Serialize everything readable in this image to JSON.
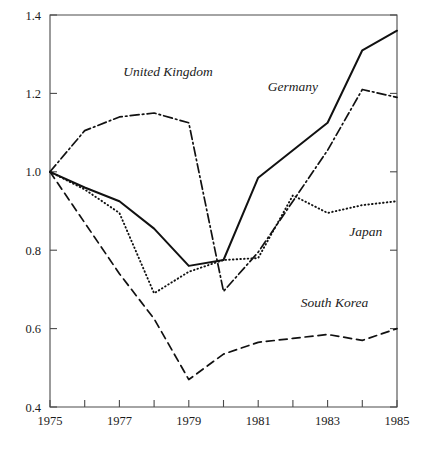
{
  "chart_data": {
    "type": "line",
    "title": "",
    "subtitle": "",
    "xlabel": "",
    "ylabel": "",
    "xlim": [
      1975,
      1985
    ],
    "ylim": [
      0.4,
      1.4
    ],
    "grid": false,
    "legend_position": "inline-annotations",
    "x": [
      1975,
      1976,
      1977,
      1978,
      1979,
      1980,
      1981,
      1982,
      1983,
      1984,
      1985
    ],
    "xticks": [
      1975,
      1976,
      1977,
      1978,
      1979,
      1980,
      1981,
      1982,
      1983,
      1984,
      1985
    ],
    "xtick_labels": [
      "1975",
      "",
      "1977",
      "",
      "1979",
      "",
      "1981",
      "",
      "1983",
      "",
      "1985"
    ],
    "yticks": [
      0.4,
      0.6,
      0.8,
      1.0,
      1.2,
      1.4
    ],
    "ytick_labels": [
      "0.4",
      "0.6",
      "0.8",
      "1.0",
      "1.2",
      "1.4"
    ],
    "series": [
      {
        "name": "Germany",
        "style": "solid",
        "label_x": 1982.0,
        "label_y": 1.205,
        "values": [
          1.0,
          0.96,
          0.925,
          0.855,
          0.76,
          0.775,
          0.985,
          1.055,
          1.125,
          1.31,
          1.36
        ]
      },
      {
        "name": "United Kingdom",
        "style": "dash-dot",
        "label_x": 1978.4,
        "label_y": 1.245,
        "values": [
          1.0,
          1.105,
          1.14,
          1.15,
          1.125,
          0.695,
          0.795,
          0.925,
          1.055,
          1.21,
          1.19
        ]
      },
      {
        "name": "Japan",
        "style": "dotted",
        "label_x": 1984.1,
        "label_y": 0.835,
        "values": [
          1.0,
          0.955,
          0.895,
          0.69,
          0.745,
          0.775,
          0.78,
          0.94,
          0.895,
          0.915,
          0.925
        ]
      },
      {
        "name": "South Korea",
        "style": "dashed",
        "label_x": 1983.2,
        "label_y": 0.655,
        "values": [
          1.0,
          0.87,
          0.74,
          0.625,
          0.47,
          0.535,
          0.565,
          0.575,
          0.585,
          0.57,
          0.6
        ]
      }
    ]
  },
  "colors": {
    "line": "#111111",
    "axis": "#4a4a4a",
    "background": "#ffffff",
    "text": "#1b1b1b"
  }
}
